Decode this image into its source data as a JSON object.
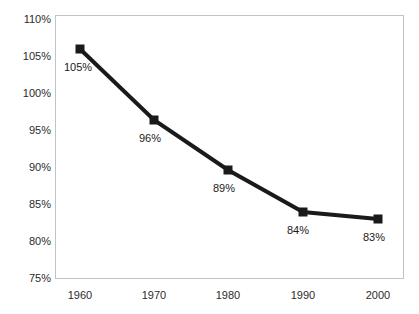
{
  "chart_data": {
    "type": "line",
    "title": "",
    "subtitle": "",
    "xlabel": "",
    "ylabel": "",
    "categories": [
      "1960",
      "1970",
      "1980",
      "1990",
      "2000"
    ],
    "x": [
      1960,
      1970,
      1980,
      1990,
      2000
    ],
    "values": [
      105,
      96,
      89,
      84,
      83
    ],
    "point_labels": [
      "105%",
      "96%",
      "89%",
      "84%",
      "83%"
    ],
    "ylim": [
      75,
      110
    ],
    "ytick_values": [
      110,
      105,
      100,
      95,
      90,
      85,
      80,
      75
    ],
    "ytick_labels": [
      "110%",
      "105%",
      "100%",
      "95%",
      "90%",
      "85%",
      "80%",
      "75%"
    ],
    "xtick_labels": [
      "1960",
      "1970",
      "1980",
      "1990",
      "2000"
    ],
    "grid": false,
    "legend": null,
    "legend_position": "none",
    "series": [
      {
        "name": "",
        "values": [
          105,
          96,
          89,
          84,
          83
        ],
        "color": "#1a1a1a",
        "marker": "square",
        "line_width": 4
      }
    ],
    "annotations": []
  },
  "style": {
    "background_color": "#ffffff",
    "plot_border_color": "#c3c3c3",
    "series_color": "#1a1a1a",
    "tick_label_color": "#2b2b2b",
    "data_label_color": "#1a1a1a"
  },
  "geometry": {
    "plot": {
      "left": 55,
      "top": 15,
      "width": 349,
      "height": 264
    },
    "y_tick_y": [
      20,
      57,
      94,
      131,
      168,
      205,
      242,
      279
    ],
    "x_tick_x": [
      80,
      154,
      228,
      303,
      378
    ],
    "points": [
      {
        "x": 80,
        "y": 49
      },
      {
        "x": 154,
        "y": 120
      },
      {
        "x": 228,
        "y": 170
      },
      {
        "x": 303,
        "y": 212
      },
      {
        "x": 378,
        "y": 219
      }
    ],
    "label_pos": [
      {
        "x": 64,
        "y": 62
      },
      {
        "x": 139,
        "y": 133
      },
      {
        "x": 213,
        "y": 183
      },
      {
        "x": 287,
        "y": 225
      },
      {
        "x": 363,
        "y": 232
      }
    ]
  }
}
